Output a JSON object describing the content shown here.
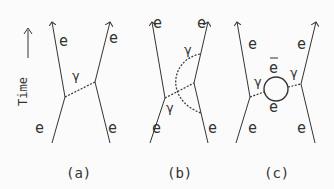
{
  "axis": {
    "label": "Time",
    "arrow": "up-arrow"
  },
  "diagrams": [
    {
      "caption": "(a)",
      "labels": {
        "top_left": "e",
        "top_right": "e",
        "bottom_left": "e",
        "bottom_right": "e",
        "photon": "γ"
      }
    },
    {
      "caption": "(b)",
      "labels": {
        "top_left": "e",
        "top_right": "e",
        "bottom_left": "e",
        "bottom_right": "e",
        "photon_upper": "γ",
        "photon_lower": "γ"
      }
    },
    {
      "caption": "(c)",
      "labels": {
        "top_left": "e",
        "top_right": "e",
        "bottom_left": "e",
        "bottom_right": "e",
        "photon_left": "γ",
        "photon_right": "γ",
        "loop_top": "e",
        "loop_bottom": "e",
        "loop_top_bar": "‾"
      }
    }
  ],
  "colors": {
    "line": "#333333",
    "background": "#fbfbfb"
  }
}
